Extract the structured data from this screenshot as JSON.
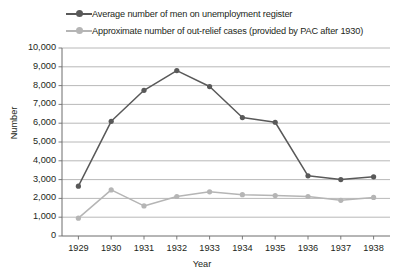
{
  "chart_data": {
    "type": "line",
    "title": "",
    "xlabel": "Year",
    "ylabel": "Number",
    "categories": [
      "1929",
      "1930",
      "1931",
      "1932",
      "1933",
      "1934",
      "1935",
      "1936",
      "1937",
      "1938"
    ],
    "ylim": [
      0,
      10000
    ],
    "ytick_labels": [
      "0",
      "1,000",
      "2,000",
      "3,000",
      "4,000",
      "5,000",
      "6,000",
      "7,000",
      "8,000",
      "9,000",
      "10,000"
    ],
    "ytick_values": [
      0,
      1000,
      2000,
      3000,
      4000,
      5000,
      6000,
      7000,
      8000,
      9000,
      10000
    ],
    "grid": true,
    "legend_position": "top-left",
    "series": [
      {
        "name": "Average number of men on unemployment register",
        "color": "#595959",
        "marker": "circle",
        "values": [
          2650,
          6100,
          7750,
          8800,
          7950,
          6300,
          6050,
          3200,
          3000,
          3150
        ]
      },
      {
        "name": "Approximate number of out-relief cases (provided by PAC after 1930)",
        "color": "#b5b5b5",
        "marker": "circle",
        "values": [
          950,
          2450,
          1600,
          2100,
          2350,
          2200,
          2150,
          2100,
          1900,
          2050
        ]
      }
    ]
  },
  "style": {
    "grid_color": "#a6a6a6",
    "axis_color": "#6d6d6d",
    "text_color": "#231f20",
    "background": "#ffffff"
  }
}
